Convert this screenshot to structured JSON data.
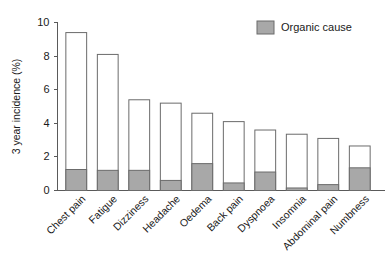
{
  "chart_data": {
    "type": "bar",
    "subtype": "stacked",
    "title": "",
    "xlabel": "",
    "ylabel": "3 year incidence (%)",
    "ylim": [
      0,
      10
    ],
    "yticks": [
      0,
      2,
      4,
      6,
      8,
      10
    ],
    "ytick_labels": [
      "0",
      "2",
      "4",
      "6",
      "8",
      "10"
    ],
    "grid": false,
    "legend_position": "top-right",
    "categories": [
      "Chest pain",
      "Fatigue",
      "Dizziness",
      "Headache",
      "Oedema",
      "Back pain",
      "Dyspnoea",
      "Insomnia",
      "Abdominal pain",
      "Numbness"
    ],
    "series": [
      {
        "name": "Total incidence",
        "color": "#ffffff",
        "values": [
          9.4,
          8.1,
          5.4,
          5.2,
          4.6,
          4.1,
          3.6,
          3.35,
          3.1,
          2.65
        ]
      },
      {
        "name": "Organic cause",
        "color": "#a8a8a8",
        "values": [
          1.25,
          1.2,
          1.2,
          0.6,
          1.6,
          0.45,
          1.1,
          0.15,
          0.35,
          1.35
        ]
      }
    ],
    "legend": [
      {
        "label": "Organic cause",
        "color": "#a8a8a8"
      }
    ]
  },
  "colors": {
    "organic_fill": "#a8a8a8",
    "bar_outline": "#6b6b6b",
    "axis": "#5a5a5a",
    "text": "#1a1a1a",
    "background": "#ffffff"
  }
}
